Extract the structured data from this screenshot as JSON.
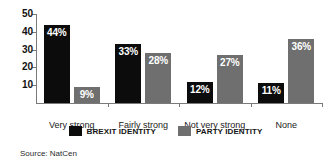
{
  "chart_data": {
    "type": "bar",
    "title": "",
    "subtitle": "",
    "xlabel": "",
    "ylabel": "",
    "categories": [
      "Very strong",
      "Fairly strong",
      "Not very strong",
      "None"
    ],
    "series": [
      {
        "name": "BREXIT IDENTITY",
        "color": "#0c0c0c",
        "values": [
          44,
          33,
          12,
          11
        ],
        "data_labels": [
          "44%",
          "33%",
          "12%",
          "11%"
        ]
      },
      {
        "name": "PARTY IDENTITY",
        "color": "#6f6f6f",
        "values": [
          9,
          28,
          27,
          36
        ],
        "data_labels": [
          "9%",
          "28%",
          "27%",
          "36%"
        ]
      }
    ],
    "ylim": [
      0,
      50
    ],
    "yticks": [
      10,
      20,
      30,
      40,
      50
    ],
    "ytick_labels": [
      "10",
      "20",
      "30",
      "40",
      "50"
    ],
    "grid": false,
    "legend_position": "bottom"
  },
  "legend": {
    "items": [
      {
        "label": "BREXIT IDENTITY",
        "color": "#0c0c0c"
      },
      {
        "label": "PARTY IDENTITY",
        "color": "#6f6f6f"
      }
    ]
  },
  "source": {
    "text": "Source: NatCen"
  }
}
